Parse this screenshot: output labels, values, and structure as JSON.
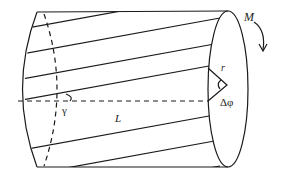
{
  "diagram": {
    "labels": {
      "moment": "M",
      "radius": "r",
      "twist_angle": "Δφ",
      "shear_angle": "γ",
      "length": "L"
    },
    "colors": {
      "stroke": "#1a1a1a",
      "text": "#222222",
      "background": "#ffffff"
    }
  }
}
